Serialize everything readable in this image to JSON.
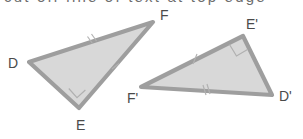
{
  "figure": {
    "kind": "geometry-diagram",
    "background_color": "#ffffff",
    "fill_color": "#c9c9c9",
    "stroke_color": "#9e9e9e",
    "label_color": "#4a4a4a",
    "tick_color": "#b2b2b2"
  },
  "cropped_header": {
    "visible": true,
    "text": "cut off line of text at top edge"
  },
  "triangle_1": {
    "name": "DEF",
    "vertices": [
      {
        "label": "D",
        "x": 29,
        "y": 62,
        "label_x": 8,
        "label_y": 68
      },
      {
        "label": "E",
        "x": 79,
        "y": 108,
        "label_x": 76,
        "label_y": 130
      },
      {
        "label": "F",
        "x": 153,
        "y": 22,
        "label_x": 160,
        "label_y": 20
      }
    ],
    "right_angle_at": "E",
    "side_marks": [
      {
        "side": "DF",
        "ticks": 2
      },
      {
        "side": "EF",
        "ticks": 1
      }
    ]
  },
  "triangle_2": {
    "name": "D'E'F'",
    "vertices": [
      {
        "label": "F'",
        "x": 141,
        "y": 87,
        "label_x": 127,
        "label_y": 103
      },
      {
        "label": "E'",
        "x": 243,
        "y": 36,
        "label_x": 246,
        "label_y": 29
      },
      {
        "label": "D'",
        "x": 272,
        "y": 95,
        "label_x": 279,
        "label_y": 101
      }
    ],
    "right_angle_at": "E'",
    "side_marks": [
      {
        "side": "F'E'",
        "ticks": 1
      },
      {
        "side": "F'D'",
        "ticks": 2
      }
    ]
  }
}
